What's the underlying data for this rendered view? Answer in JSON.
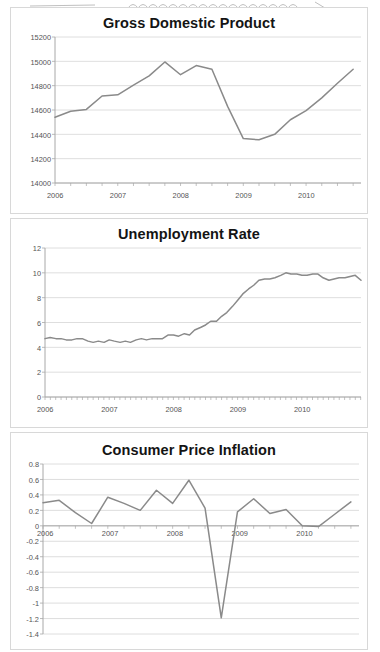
{
  "document": {
    "type": "scanned-figure-page",
    "page_background": "#ffffff",
    "artifact_note": "faint handwriting squiggle scan artifact across top edge"
  },
  "panels": [
    {
      "id": "gdp",
      "title": "Gross Domestic Product"
    },
    {
      "id": "unem",
      "title": "Unemployment Rate"
    },
    {
      "id": "cpi",
      "title": "Consumer Price Inflation"
    }
  ],
  "style": {
    "line_color": "#8a8a8a",
    "grid_color": "#d6d6d6",
    "axis_color": "#a8a8a8",
    "tick_label_color": "#555555",
    "title_color": "#141414",
    "panel_border": "#d8d8d8"
  },
  "chart_data": [
    {
      "id": "gdp",
      "type": "line",
      "title": "Gross Domestic Product",
      "xlabel": "",
      "ylabel": "",
      "grid": true,
      "legend": "none",
      "ylim": [
        14000,
        15200
      ],
      "yticks": [
        14000,
        14200,
        14400,
        14600,
        14800,
        15000,
        15200
      ],
      "ytick_labels": [
        "14000",
        "14200",
        "14400",
        "14600",
        "14800",
        "15000",
        "15200"
      ],
      "xlim": [
        2006.0,
        2010.875
      ],
      "xticks": [
        2006,
        2007,
        2008,
        2009,
        2010
      ],
      "xtick_labels": [
        "2006",
        "2007",
        "2008",
        "2009",
        "2010"
      ],
      "minor_tick_interval": 0.25,
      "frequency": "quarterly",
      "series": [
        {
          "name": "Real GDP (billions of chained dollars)",
          "x": [
            2006.0,
            2006.25,
            2006.5,
            2006.75,
            2007.0,
            2007.25,
            2007.5,
            2007.75,
            2008.0,
            2008.25,
            2008.5,
            2008.75,
            2009.0,
            2009.25,
            2009.5,
            2009.75,
            2010.0,
            2010.25,
            2010.5,
            2010.75
          ],
          "values": [
            14540,
            14590,
            14605,
            14715,
            14725,
            14805,
            14880,
            14995,
            14890,
            14965,
            14935,
            14630,
            14365,
            14355,
            14400,
            14520,
            14595,
            14700,
            14820,
            14935
          ]
        }
      ]
    },
    {
      "id": "unem",
      "type": "line",
      "title": "Unemployment Rate",
      "xlabel": "",
      "ylabel": "",
      "grid": true,
      "legend": "none",
      "ylim": [
        0,
        12
      ],
      "yticks": [
        0,
        2,
        4,
        6,
        8,
        10,
        12
      ],
      "ytick_labels": [
        "0",
        "2",
        "4",
        "6",
        "8",
        "10",
        "12"
      ],
      "xlim": [
        2006.0,
        2010.92
      ],
      "xticks": [
        2006,
        2007,
        2008,
        2009,
        2010
      ],
      "xtick_labels": [
        "2006",
        "2007",
        "2008",
        "2009",
        "2010"
      ],
      "minor_tick_interval": 0.0833,
      "frequency": "monthly",
      "series": [
        {
          "name": "Unemployment rate (percent)",
          "x": [
            2006.0,
            2006.08,
            2006.17,
            2006.25,
            2006.33,
            2006.42,
            2006.5,
            2006.58,
            2006.67,
            2006.75,
            2006.83,
            2006.92,
            2007.0,
            2007.08,
            2007.17,
            2007.25,
            2007.33,
            2007.42,
            2007.5,
            2007.58,
            2007.67,
            2007.75,
            2007.83,
            2007.92,
            2008.0,
            2008.08,
            2008.17,
            2008.25,
            2008.33,
            2008.42,
            2008.5,
            2008.58,
            2008.67,
            2008.75,
            2008.83,
            2008.92,
            2009.0,
            2009.08,
            2009.17,
            2009.25,
            2009.33,
            2009.42,
            2009.5,
            2009.58,
            2009.67,
            2009.75,
            2009.83,
            2009.92,
            2010.0,
            2010.08,
            2010.17,
            2010.25,
            2010.33,
            2010.42,
            2010.5,
            2010.58,
            2010.67,
            2010.75,
            2010.83,
            2010.92
          ],
          "values": [
            4.7,
            4.8,
            4.7,
            4.7,
            4.6,
            4.6,
            4.7,
            4.7,
            4.5,
            4.4,
            4.5,
            4.4,
            4.6,
            4.5,
            4.4,
            4.5,
            4.4,
            4.6,
            4.7,
            4.6,
            4.7,
            4.7,
            4.7,
            5.0,
            5.0,
            4.9,
            5.1,
            5.0,
            5.4,
            5.6,
            5.8,
            6.1,
            6.1,
            6.5,
            6.8,
            7.3,
            7.8,
            8.3,
            8.7,
            9.0,
            9.4,
            9.5,
            9.5,
            9.6,
            9.8,
            10.0,
            9.9,
            9.9,
            9.8,
            9.8,
            9.9,
            9.9,
            9.6,
            9.4,
            9.5,
            9.6,
            9.6,
            9.7,
            9.8,
            9.4
          ]
        }
      ]
    },
    {
      "id": "cpi",
      "type": "line",
      "title": "Consumer Price Inflation",
      "xlabel": "",
      "ylabel": "",
      "grid": true,
      "legend": "none",
      "ylim": [
        -1.4,
        0.8
      ],
      "yticks": [
        0.8,
        0.6,
        0.4,
        0.2,
        0,
        -0.2,
        -0.4,
        -0.6,
        -0.8,
        -1,
        -1.2,
        -1.4
      ],
      "ytick_labels": [
        "0.8",
        "0.6",
        "0.4",
        "0.2",
        "0",
        "-0.2",
        "-0.4",
        "-0.6",
        "-0.8",
        "-1",
        "-1.2",
        "-1.4"
      ],
      "xlim": [
        2006.0,
        2010.875
      ],
      "xticks": [
        2006,
        2007,
        2008,
        2009,
        2010
      ],
      "xtick_labels": [
        "2006",
        "2007",
        "2008",
        "2009",
        "2010"
      ],
      "minor_tick_interval": 0.25,
      "frequency": "quarterly",
      "zero_line": 0,
      "series": [
        {
          "name": "Consumer price inflation (percent change)",
          "x": [
            2006.0,
            2006.25,
            2006.5,
            2006.75,
            2007.0,
            2007.25,
            2007.5,
            2007.75,
            2008.0,
            2008.25,
            2008.5,
            2008.75,
            2009.0,
            2009.25,
            2009.5,
            2009.75,
            2010.0,
            2010.25,
            2010.5,
            2010.75
          ],
          "values": [
            0.3,
            0.33,
            0.17,
            0.03,
            0.37,
            0.29,
            0.2,
            0.46,
            0.29,
            0.59,
            0.23,
            -1.19,
            0.18,
            0.35,
            0.16,
            0.21,
            0.0,
            -0.01,
            0.15,
            0.31
          ]
        }
      ]
    }
  ]
}
